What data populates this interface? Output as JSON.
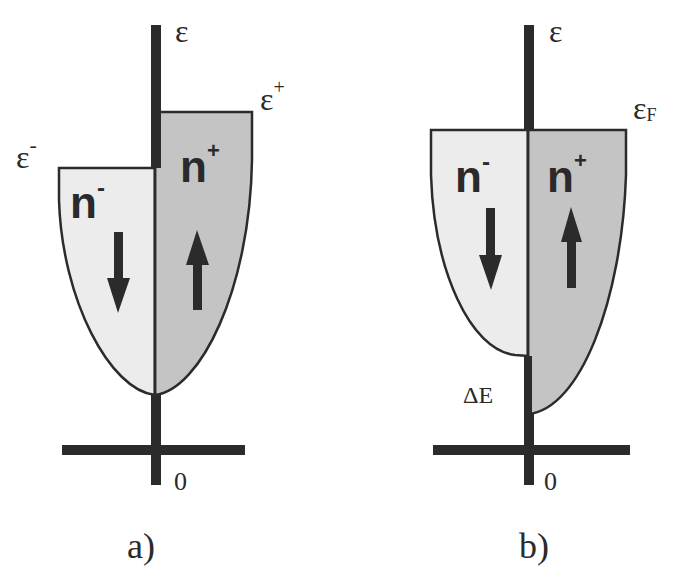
{
  "colors": {
    "axis": "#2b2b2b",
    "outline": "#2b2b2b",
    "minority_fill": "#ececec",
    "majority_fill": "#c4c4c4",
    "text": "#2a2a2a"
  },
  "panel_a": {
    "caption": "a)",
    "axis_label": "ε",
    "origin_label": "0",
    "level_plus_label": "ε",
    "level_plus_sup": "+",
    "level_minus_label": "ε",
    "level_minus_sup": "-",
    "band_minus_label": "n",
    "band_minus_sup": "-",
    "band_plus_label": "n",
    "band_plus_sup": "+",
    "spin_minus": "down-arrow",
    "spin_plus": "up-arrow"
  },
  "panel_b": {
    "caption": "b)",
    "axis_label": "ε",
    "origin_label": "0",
    "fermi_label": "ε",
    "fermi_sub": "F",
    "band_minus_label": "n",
    "band_minus_sup": "-",
    "band_plus_label": "n",
    "band_plus_sup": "+",
    "gap_label": "ΔE",
    "spin_minus": "down-arrow",
    "spin_plus": "up-arrow"
  }
}
